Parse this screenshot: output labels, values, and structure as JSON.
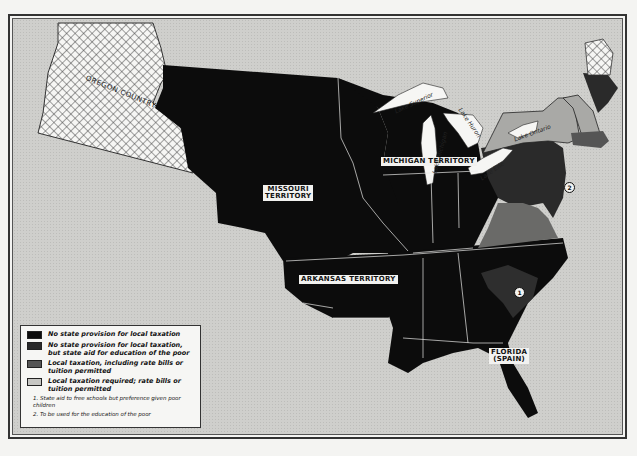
{
  "map": {
    "type": "historical thematic map",
    "subject": "State provisions for school taxation, United States",
    "colors": {
      "no_provision": "#0c0c0c",
      "state_aid_poor": "#2a2a2a",
      "local_tax_rate_bills": "#555555",
      "local_tax_required": "#a9a9a6",
      "water_background": "#cfcfcc",
      "frame": "#333333"
    },
    "region_labels": {
      "oregon": "OREGON\nCOUNTRY",
      "missouri": "MISSOURI\nTERRITORY",
      "michigan": "MICHIGAN TERRITORY",
      "arkansas": "ARKANSAS TERRITORY",
      "florida": "FLORIDA\n(SPAIN)"
    },
    "lakes": {
      "superior": "Lake Superior",
      "michigan": "Lake Michigan",
      "huron": "Lake Huron",
      "erie": "Lake Erie",
      "ontario": "Lake Ontario"
    },
    "markers": {
      "m1": "1",
      "m2": "2"
    }
  },
  "legend": {
    "items": [
      {
        "label": "No state provision for local taxation",
        "swatch": "no_provision"
      },
      {
        "label": "No state provision for local taxation, but state aid for education of the poor",
        "swatch": "state_aid_poor"
      },
      {
        "label": "Local taxation, including rate bills or tuition permitted",
        "swatch": "local_tax_rate_bills"
      },
      {
        "label": "Local taxation required; rate bills or tuition permitted",
        "swatch": "local_tax_required"
      }
    ],
    "notes": [
      "1. State aid to free schools but preference given poor children",
      "2. To be used for the education of the poor"
    ]
  }
}
